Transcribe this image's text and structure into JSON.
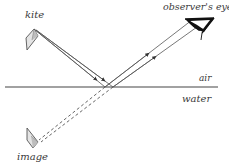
{
  "diagram": {
    "labels": {
      "kite": "kite",
      "observer_eye": "observer's eye",
      "air": "air",
      "water": "water",
      "image": "image"
    },
    "colors": {
      "ray": "#555555",
      "surface": "#444444",
      "object_fill": "#dddddd",
      "object_stroke": "#555555",
      "eye": "#111111",
      "text": "#3a3a3a"
    },
    "elements": {
      "kite": {
        "position": [
          30,
          38
        ],
        "region": "air"
      },
      "surface_line": {
        "y": 87,
        "x_start": 5,
        "x_end": 218
      },
      "incident_rays": 2,
      "reflected_rays": 2,
      "virtual_rays_dashed": 2,
      "image": {
        "position": [
          32,
          137
        ],
        "region": "water"
      },
      "observer_eye": {
        "position": [
          200,
          28
        ]
      }
    }
  }
}
